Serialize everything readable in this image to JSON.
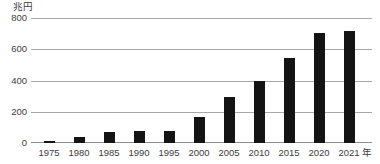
{
  "chart_data": {
    "type": "bar",
    "title": "",
    "subtitle": "",
    "unit_label": "兆円",
    "xlabel": "",
    "xaxis_unit": "年",
    "ylabel": "兆円",
    "ylim": [
      0,
      800
    ],
    "yticks": [
      800,
      600,
      400,
      200,
      0
    ],
    "ytick_labels": [
      "800",
      "600",
      "400",
      "200",
      "0"
    ],
    "grid": true,
    "legend": "none",
    "categories": [
      "1975",
      "1980",
      "1985",
      "1990",
      "1995",
      "2000",
      "2005",
      "2010",
      "2015",
      "2020",
      "2021"
    ],
    "values": [
      15,
      37,
      73,
      75,
      76,
      168,
      300,
      400,
      550,
      710,
      720
    ],
    "bar_color": "#141414",
    "gridline_color": "#a8a8a8",
    "text_color": "#3c3c3c",
    "background_color": "#ffffff"
  },
  "axis": {
    "y_unit": "兆円",
    "x_unit": "年"
  }
}
